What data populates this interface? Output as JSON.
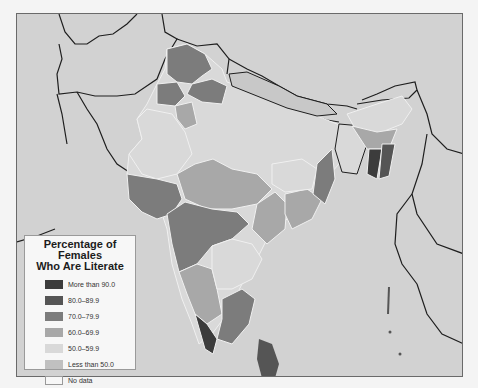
{
  "map": {
    "subject": "Percentage of Females Who Are Literate",
    "region": "South Asia",
    "background_color": "#d2d2d2",
    "border_color": "#1e1e1e"
  },
  "legend": {
    "title_line1": "Percentage of Females",
    "title_line2": "Who Are Literate",
    "items": [
      {
        "label": "More than 90.0",
        "color": "#3c3c3c"
      },
      {
        "label": "80.0–89.9",
        "color": "#555555"
      },
      {
        "label": "70.0–79.9",
        "color": "#7c7c7c"
      },
      {
        "label": "60.0–69.9",
        "color": "#a8a8a8"
      },
      {
        "label": "50.0–59.9",
        "color": "#d9d9d9"
      },
      {
        "label": "Less than 50.0",
        "color": "#c0c0c0"
      },
      {
        "label": "No data",
        "color": "#f7f7f7"
      }
    ]
  }
}
